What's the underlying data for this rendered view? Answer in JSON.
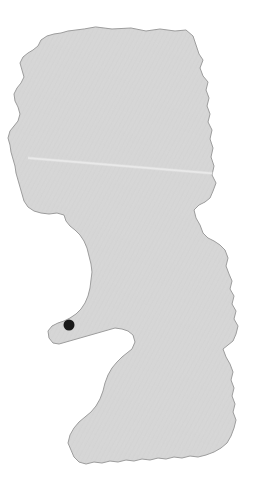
{
  "map": {
    "kind": "region-outline-map",
    "canvas": {
      "width": 258,
      "height": 486
    },
    "background_color": "#ffffff",
    "region": {
      "name": "region-area",
      "fill_color": "#d6d6d6",
      "stroke_color": "#9b9b9b",
      "stroke_width": 1,
      "texture": "diagonal-weave",
      "bounds": {
        "left": 8,
        "top": 26,
        "right": 240,
        "bottom": 466
      },
      "outline_path": "M 96,27 L 112,29 L 131,28 L 146,31 L 160,29 L 175,31 L 186,30 L 193,36 L 196,45 L 199,54 L 203,60 L 200,68 L 203,76 L 208,82 L 206,90 L 209,98 L 207,106 L 210,114 L 208,122 L 212,130 L 210,139 L 213,148 L 211,157 L 214,166 L 212,175 L 216,183 L 213,191 L 210,198 L 205,202 L 199,205 L 194,210 L 196,218 L 200,225 L 203,233 L 208,238 L 214,241 L 220,245 L 225,250 L 228,258 L 226,266 L 229,274 L 232,281 L 230,289 L 234,296 L 232,304 L 236,311 L 234,319 L 238,326 L 236,334 L 233,341 L 228,345 L 223,349 L 226,357 L 230,364 L 233,372 L 231,380 L 234,388 L 232,396 L 235,404 L 233,412 L 236,420 L 234,428 L 231,436 L 227,443 L 221,448 L 214,452 L 206,455 L 198,457 L 190,456 L 182,458 L 174,457 L 166,459 L 158,458 L 150,460 L 142,459 L 134,461 L 126,460 L 118,462 L 110,461 L 102,463 L 94,462 L 86,464 L 79,462 L 74,457 L 71,450 L 68,443 L 70,435 L 74,428 L 79,422 L 85,417 L 91,412 L 96,406 L 100,399 L 103,391 L 105,383 L 108,375 L 112,368 L 117,362 L 122,357 L 127,353 L 132,349 L 135,342 L 133,335 L 128,331 L 122,329 L 115,328 L 108,330 L 101,332 L 94,334 L 87,336 L 80,338 L 73,340 L 66,342 L 59,344 L 53,343 L 49,338 L 48,331 L 52,326 L 58,323 L 64,321 L 70,318 L 76,314 L 81,309 L 85,303 L 88,296 L 90,288 L 91,280 L 92,272 L 91,264 L 89,256 L 87,248 L 84,241 L 80,235 L 75,230 L 70,226 L 66,221 L 64,215 L 57,213 L 49,214 L 41,213 L 34,211 L 28,207 L 24,201 L 22,194 L 20,187 L 18,180 L 16,173 L 15,166 L 13,159 L 11,152 L 10,145 L 8,138 L 10,131 L 14,126 L 18,121 L 20,114 L 18,107 L 15,101 L 14,94 L 17,88 L 21,83 L 24,77 L 22,70 L 20,63 L 23,57 L 28,53 L 33,50 L 38,46 L 41,40 L 47,36 L 54,34 L 61,33 L 68,31 L 76,30 L 84,29 Z"
    },
    "markers": [
      {
        "name": "location-marker",
        "label": "",
        "x": 69,
        "y": 325,
        "radius": 5.5,
        "color": "#191919"
      }
    ],
    "artifacts": [
      {
        "name": "scan-crease-line",
        "type": "diagonal-streak",
        "x1": 28,
        "y1": 158,
        "x2": 232,
        "y2": 175,
        "color": "#ededed"
      }
    ]
  }
}
